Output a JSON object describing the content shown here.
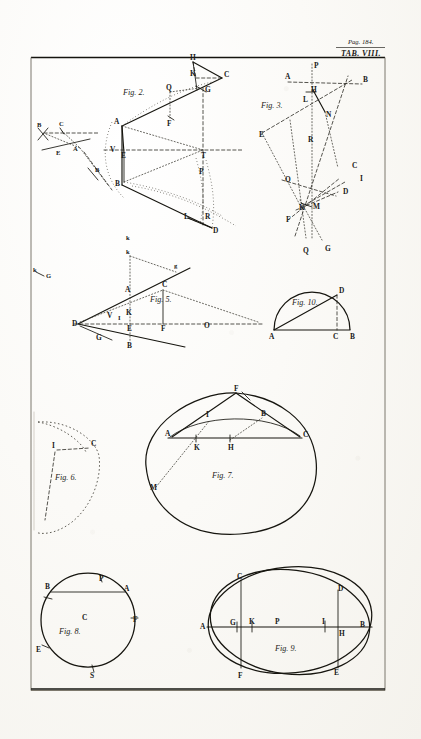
{
  "plate": {
    "page_ref": "Pag. 184.",
    "tab_label": "TAB. VIII.",
    "medium": "engraved plate"
  },
  "figures": [
    {
      "id": "fig1",
      "label": "",
      "caption": "",
      "points": [
        "B",
        "C",
        "A",
        "E",
        "B"
      ],
      "description": "small inset construction at left margin"
    },
    {
      "id": "fig2",
      "label": "Fig. 2.",
      "points": [
        "H",
        "K",
        "C",
        "Q",
        "G",
        "F",
        "A",
        "V",
        "E",
        "T",
        "P",
        "B",
        "L",
        "R",
        "D",
        "k"
      ]
    },
    {
      "id": "fig3",
      "label": "Fig. 3.",
      "points": [
        "P",
        "A",
        "B",
        "H",
        "L",
        "N",
        "E",
        "R",
        "C",
        "I",
        "O",
        "D",
        "K",
        "M",
        "F",
        "Q",
        "G"
      ]
    },
    {
      "id": "fig5",
      "label": "Fig. 5.",
      "points": [
        "k",
        "g",
        "C",
        "A",
        "K",
        "V",
        "I",
        "D",
        "E",
        "F",
        "O",
        "G",
        "B"
      ],
      "margin_points": [
        "k",
        "G"
      ]
    },
    {
      "id": "fig10",
      "label": "Fig. 10.",
      "points": [
        "A",
        "C",
        "B",
        "D"
      ],
      "shape": "semicircle"
    },
    {
      "id": "fig6",
      "label": "Fig. 6.",
      "points": [
        "I",
        "C"
      ],
      "shape": "dotted oval"
    },
    {
      "id": "fig7",
      "label": "Fig. 7.",
      "points": [
        "F",
        "I",
        "B",
        "A",
        "K",
        "H",
        "C",
        "M"
      ],
      "shape": "large oval"
    },
    {
      "id": "fig8",
      "label": "Fig. 8.",
      "points": [
        "P",
        "A",
        "B",
        "C",
        "F",
        "E",
        "S"
      ],
      "shape": "circle"
    },
    {
      "id": "fig9",
      "label": "Fig. 9.",
      "points": [
        "C",
        "D",
        "A",
        "G",
        "K",
        "P",
        "I",
        "H",
        "B",
        "F",
        "E"
      ],
      "shape": "two intersecting ellipses"
    }
  ],
  "colors": {
    "ink": "#16150f",
    "paper": "#fbfaf7",
    "border": "#6e6a5e"
  }
}
